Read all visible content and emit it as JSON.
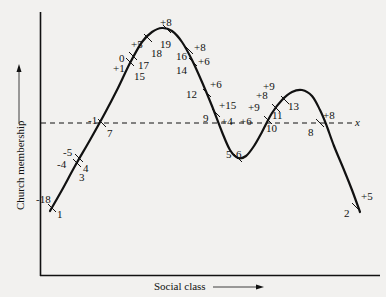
{
  "chart_data": {
    "type": "line",
    "title": "",
    "xlabel": "Social class",
    "ylabel": "Church membership",
    "reference_line": {
      "label": "x",
      "style": "dashed",
      "y_level": "mean"
    },
    "grid": false,
    "curve": [
      [
        50,
        211
      ],
      [
        62,
        190
      ],
      [
        75,
        166
      ],
      [
        90,
        140
      ],
      [
        105,
        113
      ],
      [
        118,
        88
      ],
      [
        130,
        63
      ],
      [
        142,
        42
      ],
      [
        152,
        32
      ],
      [
        162,
        28
      ],
      [
        172,
        31
      ],
      [
        182,
        42
      ],
      [
        192,
        60
      ],
      [
        202,
        82
      ],
      [
        212,
        106
      ],
      [
        222,
        132
      ],
      [
        230,
        150
      ],
      [
        238,
        158
      ],
      [
        246,
        156
      ],
      [
        254,
        146
      ],
      [
        262,
        132
      ],
      [
        272,
        113
      ],
      [
        282,
        100
      ],
      [
        292,
        92
      ],
      [
        302,
        90
      ],
      [
        312,
        96
      ],
      [
        320,
        110
      ],
      [
        326,
        124
      ],
      [
        334,
        146
      ],
      [
        344,
        170
      ],
      [
        352,
        190
      ],
      [
        360,
        212
      ]
    ],
    "points": [
      {
        "id": "1",
        "value": "-18",
        "x": 52,
        "y": 208,
        "id_pos": [
          57,
          214
        ],
        "val_pos": [
          36,
          199
        ]
      },
      {
        "id": "3",
        "value": "-4",
        "x": 77,
        "y": 163,
        "id_pos": [
          79,
          177
        ],
        "val_pos": [
          57,
          164
        ]
      },
      {
        "id": "4",
        "value": "-5",
        "x": 79,
        "y": 158,
        "id_pos": [
          83,
          168
        ],
        "val_pos": [
          63,
          152
        ]
      },
      {
        "id": "7",
        "value": "-1",
        "x": 102,
        "y": 123,
        "id_pos": [
          107,
          133
        ],
        "val_pos": [
          88,
          120
        ]
      },
      {
        "id": "15",
        "value": "+1",
        "x": 130,
        "y": 62,
        "id_pos": [
          134,
          76
        ],
        "val_pos": [
          113,
          68
        ]
      },
      {
        "id": "17",
        "value": "0",
        "x": 133,
        "y": 56,
        "id_pos": [
          138,
          65
        ],
        "val_pos": [
          119,
          58
        ]
      },
      {
        "id": "18",
        "value": "+5",
        "x": 148,
        "y": 38,
        "id_pos": [
          151,
          53
        ],
        "val_pos": [
          131,
          44
        ]
      },
      {
        "id": "19",
        "value": "+8",
        "x": 167,
        "y": 29,
        "id_pos": [
          160,
          44
        ],
        "val_pos": [
          160,
          22
        ]
      },
      {
        "id": "16",
        "value": "+8",
        "x": 189,
        "y": 50,
        "id_pos": [
          176,
          56
        ],
        "val_pos": [
          194,
          47
        ]
      },
      {
        "id": "14",
        "value": "+6",
        "x": 193,
        "y": 62,
        "id_pos": [
          176,
          70
        ],
        "val_pos": [
          198,
          61
        ]
      },
      {
        "id": "12",
        "value": "+6",
        "x": 207,
        "y": 93,
        "id_pos": [
          186,
          94
        ],
        "val_pos": [
          210,
          84
        ]
      },
      {
        "id": "9",
        "value": "+15",
        "x": 216,
        "y": 113,
        "id_pos": [
          203,
          118
        ],
        "val_pos": [
          219,
          105
        ]
      },
      {
        "id": "5",
        "value": "+4",
        "x": 234,
        "y": 155,
        "id_pos": [
          226,
          154
        ],
        "val_pos": [
          221,
          121
        ]
      },
      {
        "id": "6",
        "value": "+6",
        "x": 238,
        "y": 158,
        "id_pos": [
          236,
          154
        ],
        "val_pos": [
          240,
          121
        ]
      },
      {
        "id": "10",
        "value": "+9",
        "x": 268,
        "y": 120,
        "id_pos": [
          266,
          128
        ],
        "val_pos": [
          248,
          107
        ]
      },
      {
        "id": "11",
        "value": "+8",
        "x": 276,
        "y": 108,
        "id_pos": [
          272,
          115
        ],
        "val_pos": [
          256,
          95
        ]
      },
      {
        "id": "13",
        "value": "+9",
        "x": 285,
        "y": 100,
        "id_pos": [
          288,
          106
        ],
        "val_pos": [
          263,
          86
        ]
      },
      {
        "id": "8",
        "value": "+8",
        "x": 320,
        "y": 123,
        "id_pos": [
          308,
          132
        ],
        "val_pos": [
          323,
          115
        ]
      },
      {
        "id": "2",
        "value": "+5",
        "x": 356,
        "y": 207,
        "id_pos": [
          344,
          213
        ],
        "val_pos": [
          361,
          196
        ]
      }
    ]
  },
  "axes": {
    "x_label": "Social class",
    "y_label": "Church membership",
    "ref_label": "x"
  }
}
